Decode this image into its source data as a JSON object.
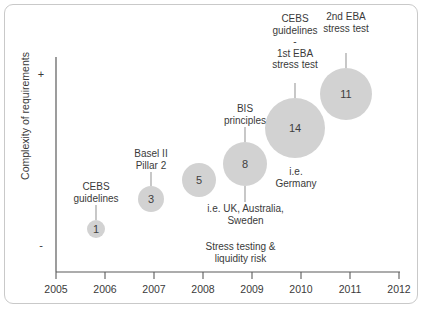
{
  "chart_data": {
    "type": "scatter",
    "title": "",
    "xlabel": "",
    "ylabel": "Complexity of requirements",
    "xlim": [
      2005,
      2012
    ],
    "x_ticks": [
      "2005",
      "2006",
      "2007",
      "2008",
      "2009",
      "2010",
      "2011",
      "2012"
    ],
    "y_axis_high_sign": "+",
    "y_axis_low_sign": "-",
    "grid": false,
    "legend": "none",
    "points": [
      {
        "x": 2006,
        "label": "1",
        "value": 1,
        "complexity": 0.17,
        "annotation": "CEBS\nguidelines"
      },
      {
        "x": 2007,
        "label": "3",
        "value": 3,
        "complexity": 0.33,
        "annotation": "Basel II\nPillar 2"
      },
      {
        "x": 2008,
        "label": "5",
        "value": 5,
        "complexity": 0.43,
        "annotation": ""
      },
      {
        "x": 2009,
        "label": "8",
        "value": 8,
        "complexity": 0.5,
        "annotation": "BIS\nprinciples"
      },
      {
        "x": 2010,
        "label": "14",
        "value": 14,
        "complexity": 0.67,
        "annotation": "CEBS\nguidelines\n-\n1st EBA\nstress test"
      },
      {
        "x": 2011,
        "label": "11",
        "value": 11,
        "complexity": 0.83,
        "annotation": "2nd EBA\nstress test"
      }
    ],
    "notes": [
      {
        "text": "i.e. UK, Australia,\nSweden"
      },
      {
        "text": "i.e.\nGermany"
      },
      {
        "text": "Stress testing &\nliquidity risk"
      }
    ],
    "colors": {
      "bubble_fill": "#d2d2d2",
      "axis": "#5b5b5b",
      "text": "#3a3a3a",
      "frame_border": "#c9c9c9",
      "connector": "#9a9a9a"
    }
  },
  "axis": {
    "y_label": "Complexity of requirements",
    "plus_sign": "+",
    "minus_sign": "-",
    "ticks": {
      "t2005": "2005",
      "t2006": "2006",
      "t2007": "2007",
      "t2008": "2008",
      "t2009": "2009",
      "t2010": "2010",
      "t2011": "2011",
      "t2012": "2012"
    }
  },
  "bubbles": {
    "b1": "1",
    "b3": "3",
    "b5": "5",
    "b8": "8",
    "b14": "14",
    "b11": "11"
  },
  "annotations": {
    "cebs_guidelines": "CEBS\nguidelines",
    "basel_ii_pillar_2": "Basel II\nPillar 2",
    "bis_principles": "BIS\nprinciples",
    "cebs_1st_eba": "CEBS\nguidelines\n-\n1st EBA\nstress test",
    "second_eba": "2nd EBA\nstress test",
    "ie_uk_australia_sweden": "i.e. UK, Australia,\nSweden",
    "ie_germany": "i.e.\nGermany",
    "stress_testing_liquidity": "Stress testing &\nliquidity risk"
  }
}
